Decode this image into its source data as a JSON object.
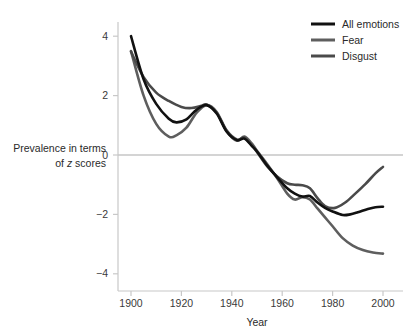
{
  "chart_data": {
    "type": "line",
    "title": "",
    "xlabel": "Year",
    "ylabel": "Prevalence in terms of z scores",
    "ylabel_line1": "Prevalence in terms",
    "ylabel_line2_pre": "of ",
    "ylabel_line2_italic": "z",
    "ylabel_line2_post": " scores",
    "xlim": [
      1898,
      2002
    ],
    "ylim": [
      -4.6,
      4.6
    ],
    "xticks": [
      1900,
      1920,
      1940,
      1960,
      1980,
      2000
    ],
    "xtick_labels": [
      "1900",
      "1920",
      "1940",
      "1960",
      "1980",
      "2000"
    ],
    "yticks": [
      4,
      2,
      0,
      -2,
      -4
    ],
    "ytick_labels": [
      "4",
      "2",
      "0",
      "−2",
      "−4"
    ],
    "grid": false,
    "zero_line": true,
    "legend_position": "top-right",
    "series": [
      {
        "name": "All emotions",
        "color": "#111111",
        "width": 2.6,
        "x": [
          1900,
          1905,
          1910,
          1915,
          1918,
          1922,
          1926,
          1930,
          1934,
          1938,
          1942,
          1945,
          1948,
          1950,
          1954,
          1958,
          1962,
          1965,
          1968,
          1971,
          1974,
          1977,
          1980,
          1984,
          1987,
          1990,
          1994,
          1997,
          2000
        ],
        "values": [
          4.0,
          2.55,
          1.72,
          1.22,
          1.1,
          1.2,
          1.52,
          1.68,
          1.4,
          0.78,
          0.5,
          0.55,
          0.3,
          0.12,
          -0.35,
          -0.75,
          -1.12,
          -1.3,
          -1.4,
          -1.38,
          -1.6,
          -1.78,
          -1.9,
          -2.02,
          -2.0,
          -1.93,
          -1.82,
          -1.76,
          -1.74
        ]
      },
      {
        "name": "Fear",
        "color": "#5e5e5e",
        "width": 2.6,
        "x": [
          1900,
          1905,
          1910,
          1915,
          1918,
          1922,
          1926,
          1930,
          1934,
          1938,
          1942,
          1945,
          1948,
          1950,
          1954,
          1958,
          1962,
          1965,
          1968,
          1971,
          1974,
          1977,
          1980,
          1984,
          1988,
          1992,
          1996,
          2000
        ],
        "values": [
          3.5,
          2.0,
          1.05,
          0.62,
          0.66,
          0.92,
          1.42,
          1.68,
          1.45,
          0.8,
          0.48,
          0.62,
          0.38,
          0.14,
          -0.3,
          -0.78,
          -1.3,
          -1.5,
          -1.42,
          -1.5,
          -1.8,
          -2.1,
          -2.4,
          -2.8,
          -3.05,
          -3.2,
          -3.28,
          -3.32
        ]
      },
      {
        "name": "Disgust",
        "color": "#4a4a4a",
        "width": 2.6,
        "x": [
          1900,
          1905,
          1910,
          1915,
          1920,
          1924,
          1928,
          1930,
          1934,
          1938,
          1942,
          1945,
          1948,
          1950,
          1954,
          1958,
          1962,
          1965,
          1968,
          1971,
          1974,
          1977,
          1981,
          1985,
          1989,
          1993,
          1997,
          2000
        ],
        "values": [
          3.48,
          2.62,
          2.1,
          1.82,
          1.62,
          1.58,
          1.66,
          1.7,
          1.42,
          0.82,
          0.52,
          0.58,
          0.32,
          0.1,
          -0.38,
          -0.72,
          -0.95,
          -1.0,
          -1.02,
          -1.12,
          -1.45,
          -1.72,
          -1.78,
          -1.6,
          -1.3,
          -0.98,
          -0.62,
          -0.4
        ]
      }
    ]
  },
  "legend": {
    "entries": [
      {
        "label": "All emotions",
        "color": "#111111"
      },
      {
        "label": "Fear",
        "color": "#5e5e5e"
      },
      {
        "label": "Disgust",
        "color": "#4a4a4a"
      }
    ]
  },
  "colors": {
    "background": "#ffffff",
    "axis": "#c8c8c8",
    "zero_line": "#c6c6c6",
    "text": "#2a2a2a"
  }
}
